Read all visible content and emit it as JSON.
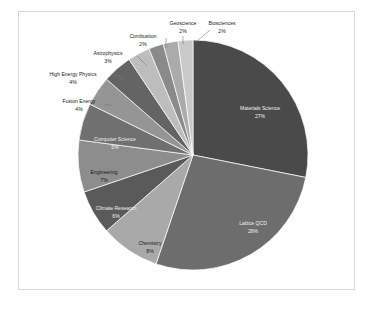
{
  "chart_data": {
    "type": "pie",
    "title": "",
    "subtitle": "",
    "xlabel": "",
    "ylabel": "",
    "legend_position": "none",
    "grid": false,
    "label_format": "category + percent",
    "start_angle_deg": 0,
    "direction": "clockwise",
    "categories": [
      "Materials Science",
      "Lattice QCD",
      "Chemistry",
      "Climate Research",
      "Engineering",
      "Computer Science",
      "Fusion Energy",
      "High Energy Physics",
      "Astrophysics",
      "Combustion",
      "Geoscience",
      "Biosciences"
    ],
    "values": [
      27,
      26,
      8,
      6,
      7,
      5,
      4,
      4,
      3,
      2,
      2,
      2
    ],
    "value_labels": [
      "27%",
      "26%",
      "8%",
      "6%",
      "7%",
      "5%",
      "4%",
      "4%",
      "3%",
      "2%",
      "2%",
      "2%"
    ],
    "colors": [
      "#4a4a4a",
      "#6d6d6d",
      "#a9a9a9",
      "#5a5a5a",
      "#8d8d8d",
      "#707070",
      "#959595",
      "#646464",
      "#bdbdbd",
      "#8a8a8a",
      "#ababab",
      "#c9c9c9"
    ]
  },
  "slices": [
    {
      "label": "Materials Science",
      "percent_label": "27%",
      "name": "materials-science",
      "label_placement": "inside",
      "label_x": 260,
      "label_y": 110,
      "percent_x": 260,
      "percent_y": 118,
      "text_anchor": "middle",
      "light_text": true,
      "leader": ""
    },
    {
      "label": "Lattice QCD",
      "percent_label": "26%",
      "name": "lattice-qcd",
      "label_placement": "inside",
      "label_x": 253,
      "label_y": 225,
      "percent_x": 253,
      "percent_y": 233,
      "text_anchor": "middle",
      "light_text": true,
      "leader": ""
    },
    {
      "label": "Chemistry",
      "percent_label": "8%",
      "name": "chemistry",
      "label_placement": "inside",
      "label_x": 150,
      "label_y": 245,
      "percent_x": 150,
      "percent_y": 253,
      "text_anchor": "middle",
      "light_text": false,
      "leader": ""
    },
    {
      "label": "Climate Research",
      "percent_label": "6%",
      "name": "climate-research",
      "label_placement": "inside",
      "label_x": 116,
      "label_y": 210,
      "percent_x": 116,
      "percent_y": 218,
      "text_anchor": "middle",
      "light_text": true,
      "leader": ""
    },
    {
      "label": "Engineering",
      "percent_label": "7%",
      "name": "engineering",
      "label_placement": "inside",
      "label_x": 104,
      "label_y": 174,
      "percent_x": 104,
      "percent_y": 182,
      "text_anchor": "middle",
      "light_text": false,
      "leader": ""
    },
    {
      "label": "Computer Science",
      "percent_label": "5%",
      "name": "computer-science",
      "label_placement": "inside",
      "label_x": 115,
      "label_y": 141,
      "percent_x": 115,
      "percent_y": 149,
      "text_anchor": "middle",
      "light_text": true,
      "leader": ""
    },
    {
      "label": "Fusion Energy",
      "percent_label": "4%",
      "name": "fusion-energy",
      "label_placement": "outside",
      "label_x": 79,
      "label_y": 103,
      "percent_x": 79,
      "percent_y": 111,
      "text_anchor": "middle",
      "light_text": false,
      "leader": "M 104 105 L 112 105"
    },
    {
      "label": "High Energy Physics",
      "percent_label": "4%",
      "name": "high-energy-physics",
      "label_placement": "outside",
      "label_x": 73,
      "label_y": 76,
      "percent_x": 73,
      "percent_y": 84,
      "text_anchor": "middle",
      "light_text": false,
      "leader": "M 114 74 L 124 79"
    },
    {
      "label": "Astrophysics",
      "percent_label": "3%",
      "name": "astrophysics",
      "label_placement": "outside",
      "label_x": 108,
      "label_y": 55,
      "percent_x": 108,
      "percent_y": 63,
      "text_anchor": "middle",
      "light_text": false,
      "leader": "M 137 56 L 147 66"
    },
    {
      "label": "Combustion",
      "percent_label": "2%",
      "name": "combustion",
      "label_placement": "outside",
      "label_x": 143,
      "label_y": 38,
      "percent_x": 143,
      "percent_y": 46,
      "text_anchor": "middle",
      "light_text": false,
      "leader": "M 166 38 L 166 48"
    },
    {
      "label": "Geoscience",
      "percent_label": "2%",
      "name": "geoscience",
      "label_placement": "outside",
      "label_x": 183,
      "label_y": 25,
      "percent_x": 183,
      "percent_y": 33,
      "text_anchor": "middle",
      "light_text": false,
      "leader": "M 183 36 L 183 44"
    },
    {
      "label": "Biosciences",
      "percent_label": "2%",
      "name": "biosciences",
      "label_placement": "outside",
      "label_x": 222,
      "label_y": 25,
      "percent_x": 222,
      "percent_y": 33,
      "text_anchor": "middle",
      "light_text": false,
      "leader": "M 210 30 L 196 42"
    }
  ],
  "geometry": {
    "center_x": 193,
    "center_y": 155,
    "radius": 115
  }
}
